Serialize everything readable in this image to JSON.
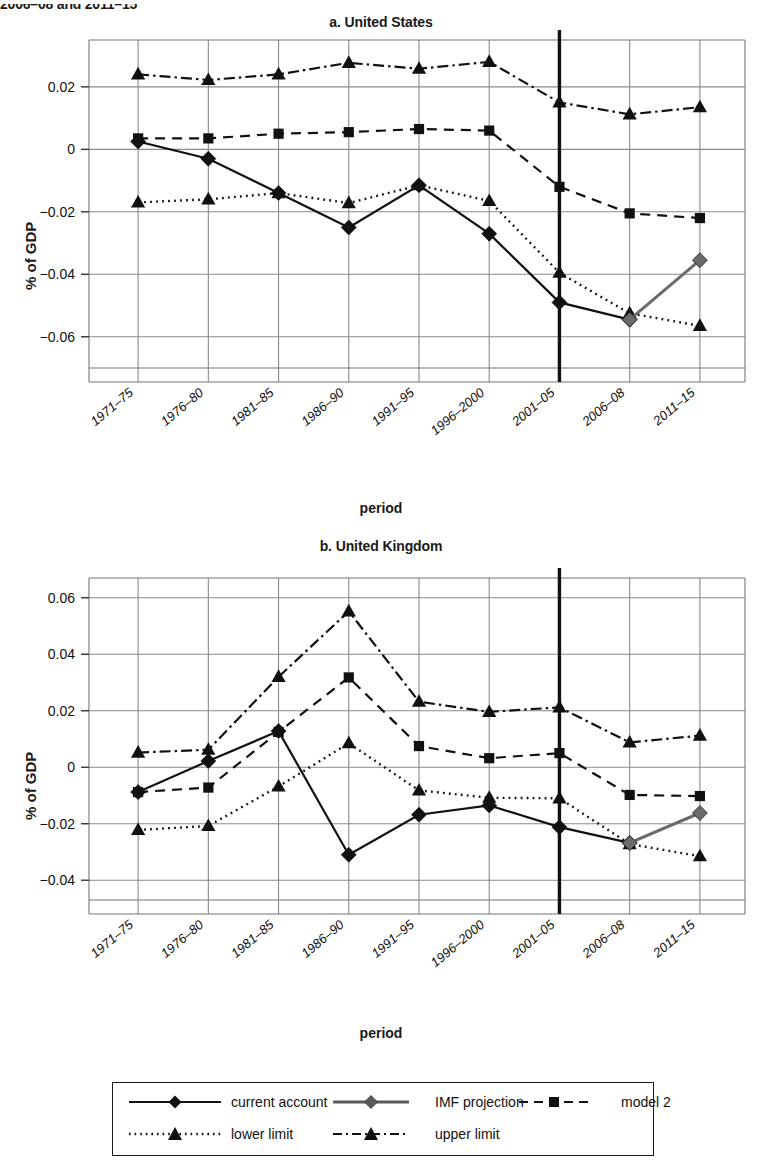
{
  "caption_fragment": "2006–08 and 2011–15",
  "axis": {
    "ylabel": "% of GDP",
    "xlabel": "period"
  },
  "legend": {
    "items": [
      {
        "label": "current account",
        "style": "solid-diamond",
        "color": "#111111"
      },
      {
        "label": "IMF projection",
        "style": "solid-diamond-gray",
        "color": "#5a5a5a"
      },
      {
        "label": "model 2",
        "style": "dashed-square",
        "color": "#111111"
      },
      {
        "label": "lower limit",
        "style": "dotted-triangle",
        "color": "#111111"
      },
      {
        "label": "upper limit",
        "style": "dashdot-triangle",
        "color": "#111111"
      }
    ]
  },
  "chart_data": [
    {
      "type": "line",
      "title": "a. United States",
      "xlabel": "period",
      "ylabel": "% of GDP",
      "categories": [
        "1971–75",
        "1976–80",
        "1981–85",
        "1986–90",
        "1991–95",
        "1996–2000",
        "2001–05",
        "2006–08",
        "2011–15"
      ],
      "ylim": [
        -0.07,
        0.035
      ],
      "yticks": [
        0.02,
        0,
        -0.02,
        -0.04,
        -0.06
      ],
      "ytick_labels": [
        "0.02",
        "0",
        "−0.02",
        "−0.04",
        "−0.06"
      ],
      "grid": true,
      "projection_divider_after": "2001–05",
      "series": [
        {
          "name": "current account",
          "style": "solid-diamond",
          "values": [
            0.0025,
            -0.003,
            -0.014,
            -0.025,
            -0.0115,
            -0.027,
            -0.049,
            -0.0545,
            null
          ]
        },
        {
          "name": "IMF projection",
          "style": "solid-diamond-gray",
          "values": [
            null,
            null,
            null,
            null,
            null,
            null,
            null,
            -0.0545,
            -0.0355
          ]
        },
        {
          "name": "model 2",
          "style": "dashed-square",
          "values": [
            0.0035,
            0.0035,
            0.005,
            0.0055,
            0.0065,
            0.006,
            -0.012,
            -0.0205,
            -0.022
          ]
        },
        {
          "name": "lower limit",
          "style": "dotted-triangle",
          "values": [
            -0.017,
            -0.016,
            -0.014,
            -0.0172,
            -0.0115,
            -0.0165,
            -0.0395,
            -0.0525,
            -0.0565
          ]
        },
        {
          "name": "upper limit",
          "style": "dashdot-triangle",
          "values": [
            0.024,
            0.0222,
            0.024,
            0.0277,
            0.0258,
            0.028,
            0.015,
            0.0112,
            0.0135
          ]
        }
      ]
    },
    {
      "type": "line",
      "title": "b. United Kingdom",
      "xlabel": "period",
      "ylabel": "% of GDP",
      "categories": [
        "1971–75",
        "1976–80",
        "1981–85",
        "1986–90",
        "1991–95",
        "1996–2000",
        "2001–05",
        "2006–08",
        "2011–15"
      ],
      "ylim": [
        -0.047,
        0.067
      ],
      "yticks": [
        0.06,
        0.04,
        0.02,
        0,
        -0.02,
        -0.04
      ],
      "ytick_labels": [
        "0.06",
        "0.04",
        "0.02",
        "0",
        "−0.02",
        "−0.04"
      ],
      "grid": true,
      "projection_divider_after": "2001–05",
      "series": [
        {
          "name": "current account",
          "style": "solid-diamond",
          "values": [
            -0.0088,
            0.0022,
            0.0128,
            -0.031,
            -0.0168,
            -0.0135,
            -0.0212,
            -0.0268,
            null
          ]
        },
        {
          "name": "IMF projection",
          "style": "solid-diamond-gray",
          "values": [
            null,
            null,
            null,
            null,
            null,
            null,
            null,
            -0.0268,
            -0.0162
          ]
        },
        {
          "name": "model 2",
          "style": "dashed-square",
          "values": [
            -0.0088,
            -0.0072,
            0.0125,
            0.0318,
            0.0075,
            0.0032,
            0.005,
            -0.0098,
            -0.0102
          ]
        },
        {
          "name": "lower limit",
          "style": "dotted-triangle",
          "values": [
            -0.0222,
            -0.0208,
            -0.0068,
            0.0085,
            -0.0082,
            -0.0108,
            -0.011,
            -0.0272,
            -0.0315
          ]
        },
        {
          "name": "upper limit",
          "style": "dashdot-triangle",
          "values": [
            0.0052,
            0.0062,
            0.032,
            0.0552,
            0.0232,
            0.0196,
            0.0212,
            0.0088,
            0.0112
          ]
        }
      ]
    }
  ]
}
